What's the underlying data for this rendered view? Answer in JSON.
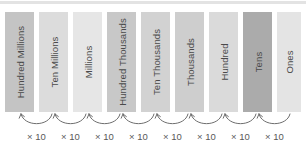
{
  "diagram": {
    "top_band_color": "#e3e3e3",
    "background_color": "#ffffff",
    "label_color": "#4a4a4a",
    "arrow_color": "#6e6e6e",
    "mult_label_color": "#585858",
    "bars": [
      {
        "label": "Hundred Millions",
        "color": "#c4c4c4",
        "x": 5,
        "width": 29
      },
      {
        "label": "Ten Millions",
        "color": "#dcdcdc",
        "x": 39,
        "width": 29
      },
      {
        "label": "Millions",
        "color": "#e6e6e6",
        "x": 73,
        "width": 29
      },
      {
        "label": "Hundred Thousands",
        "color": "#c8c8c8",
        "x": 107,
        "width": 29
      },
      {
        "label": "Ten Thousands",
        "color": "#d2d2d2",
        "x": 141,
        "width": 29
      },
      {
        "label": "Thousands",
        "color": "#cecece",
        "x": 175,
        "width": 29
      },
      {
        "label": "Hundred",
        "color": "#dadada",
        "x": 209,
        "width": 29
      },
      {
        "label": "Tens",
        "color": "#ababab",
        "x": 243,
        "width": 29
      },
      {
        "label": "Ones",
        "color": "#e4e4e4",
        "x": 277,
        "width": 24
      }
    ],
    "arrows": [
      {
        "label": "× 10",
        "x": 19,
        "width": 35
      },
      {
        "label": "× 10",
        "x": 53,
        "width": 35
      },
      {
        "label": "× 10",
        "x": 87,
        "width": 35
      },
      {
        "label": "× 10",
        "x": 121,
        "width": 35
      },
      {
        "label": "× 10",
        "x": 155,
        "width": 35
      },
      {
        "label": "× 10",
        "x": 189,
        "width": 35
      },
      {
        "label": "× 10",
        "x": 223,
        "width": 35
      },
      {
        "label": "× 10",
        "x": 257,
        "width": 35
      }
    ]
  }
}
